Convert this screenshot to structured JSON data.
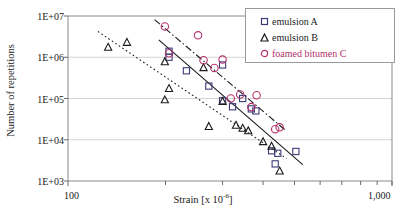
{
  "chart_data": {
    "type": "scatter",
    "title": "",
    "xlabel": "Strain [x 10-6]",
    "xlabel_base": "Strain [x 10",
    "xlabel_exp": "-6",
    "xlabel_tail": "]",
    "ylabel": "Number of repetitions",
    "xscale": "log",
    "yscale": "log",
    "xlim": [
      100,
      1000
    ],
    "ylim": [
      1000,
      10000000
    ],
    "xticks": [
      100,
      1000
    ],
    "xticklabels": [
      "100",
      "1,000"
    ],
    "yticks": [
      1000,
      10000,
      100000,
      1000000,
      10000000
    ],
    "yticklabels": [
      "1E+03",
      "1E+04",
      "1E+05",
      "1E+06",
      "1E+07"
    ],
    "grid": "horizontal",
    "legend_position": "top-right",
    "series": [
      {
        "name": "emulsion A",
        "marker": "square",
        "color": "#3b3b7a",
        "trendline": "solid",
        "points": [
          [
            205,
            1400000
          ],
          [
            205,
            1000000
          ],
          [
            232,
            470000
          ],
          [
            272,
            200000
          ],
          [
            300,
            88000
          ],
          [
            322,
            63000
          ],
          [
            346,
            100000
          ],
          [
            300,
            650000
          ],
          [
            368,
            56000
          ],
          [
            380,
            50000
          ],
          [
            425,
            5400
          ],
          [
            444,
            4700
          ],
          [
            436,
            2600
          ],
          [
            505,
            5200
          ]
        ]
      },
      {
        "name": "emulsion B",
        "marker": "triangle",
        "color": "#1a1a1a",
        "trendline": "dotted",
        "points": [
          [
            133,
            1750000
          ],
          [
            152,
            2300000
          ],
          [
            199,
            780000
          ],
          [
            205,
            175000
          ],
          [
            199,
            93000
          ],
          [
            262,
            560000
          ],
          [
            272,
            21000
          ],
          [
            300,
            85000
          ],
          [
            330,
            22500
          ],
          [
            346,
            19000
          ],
          [
            360,
            16500
          ],
          [
            400,
            9000
          ],
          [
            425,
            7000
          ],
          [
            450,
            1750
          ]
        ]
      },
      {
        "name": "foamed bitumen C",
        "marker": "circle",
        "color": "#b3316b",
        "trendline": "dash-dot",
        "points": [
          [
            199,
            5600000
          ],
          [
            252,
            3400000
          ],
          [
            205,
            1250000
          ],
          [
            262,
            850000
          ],
          [
            283,
            550000
          ],
          [
            300,
            880000
          ],
          [
            318,
            100000
          ],
          [
            340,
            125000
          ],
          [
            368,
            62000
          ],
          [
            382,
            120000
          ],
          [
            436,
            18000
          ],
          [
            450,
            20000
          ]
        ]
      }
    ]
  }
}
